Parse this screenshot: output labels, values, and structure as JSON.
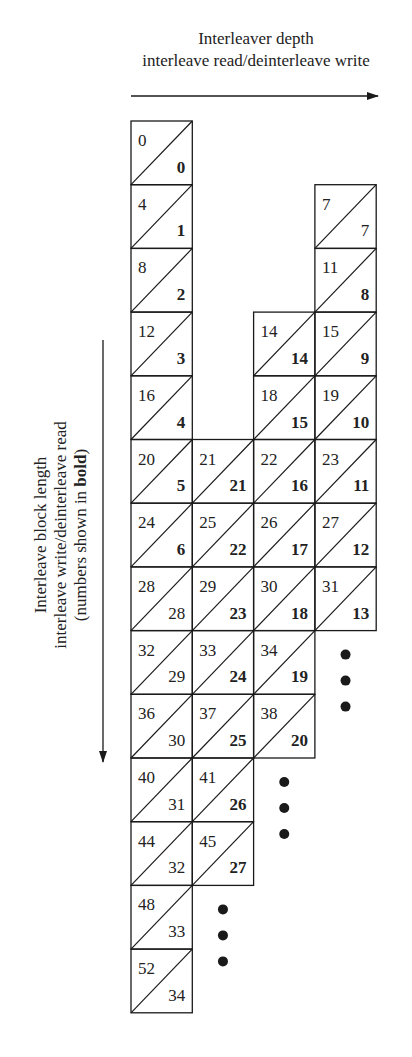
{
  "top_axis": {
    "title": "Interleaver depth",
    "subtitle": "interleave read/deinterleave write",
    "arrow_direction": "right"
  },
  "side_axis": {
    "title": "Interleave block length",
    "subtitle": "interleave write/deinterleave read",
    "note_prefix": "(numbers shown in ",
    "note_bold": "bold",
    "note_suffix": ")",
    "arrow_direction": "down"
  },
  "grid": {
    "origin_x": 131,
    "origin_y": 121,
    "col_width": 61.3,
    "row_height": 63.7,
    "columns": 4,
    "cells": [
      {
        "col": 0,
        "row": 0,
        "top": "0",
        "bottom": "0",
        "bold": true
      },
      {
        "col": 0,
        "row": 1,
        "top": "4",
        "bottom": "1",
        "bold": true
      },
      {
        "col": 0,
        "row": 2,
        "top": "8",
        "bottom": "2",
        "bold": true
      },
      {
        "col": 0,
        "row": 3,
        "top": "12",
        "bottom": "3",
        "bold": true
      },
      {
        "col": 0,
        "row": 4,
        "top": "16",
        "bottom": "4",
        "bold": true
      },
      {
        "col": 0,
        "row": 5,
        "top": "20",
        "bottom": "5",
        "bold": true
      },
      {
        "col": 0,
        "row": 6,
        "top": "24",
        "bottom": "6",
        "bold": true
      },
      {
        "col": 0,
        "row": 7,
        "top": "28",
        "bottom": "28",
        "bold": false
      },
      {
        "col": 0,
        "row": 8,
        "top": "32",
        "bottom": "29",
        "bold": false
      },
      {
        "col": 0,
        "row": 9,
        "top": "36",
        "bottom": "30",
        "bold": false
      },
      {
        "col": 0,
        "row": 10,
        "top": "40",
        "bottom": "31",
        "bold": false
      },
      {
        "col": 0,
        "row": 11,
        "top": "44",
        "bottom": "32",
        "bold": false
      },
      {
        "col": 0,
        "row": 12,
        "top": "48",
        "bottom": "33",
        "bold": false
      },
      {
        "col": 0,
        "row": 13,
        "top": "52",
        "bottom": "34",
        "bold": false
      },
      {
        "col": 1,
        "row": 5,
        "top": "21",
        "bottom": "21",
        "bold": true
      },
      {
        "col": 1,
        "row": 6,
        "top": "25",
        "bottom": "22",
        "bold": true
      },
      {
        "col": 1,
        "row": 7,
        "top": "29",
        "bottom": "23",
        "bold": true
      },
      {
        "col": 1,
        "row": 8,
        "top": "33",
        "bottom": "24",
        "bold": true
      },
      {
        "col": 1,
        "row": 9,
        "top": "37",
        "bottom": "25",
        "bold": true
      },
      {
        "col": 1,
        "row": 10,
        "top": "41",
        "bottom": "26",
        "bold": true
      },
      {
        "col": 1,
        "row": 11,
        "top": "45",
        "bottom": "27",
        "bold": true
      },
      {
        "col": 2,
        "row": 3,
        "top": "14",
        "bottom": "14",
        "bold": true
      },
      {
        "col": 2,
        "row": 4,
        "top": "18",
        "bottom": "15",
        "bold": true
      },
      {
        "col": 2,
        "row": 5,
        "top": "22",
        "bottom": "16",
        "bold": true
      },
      {
        "col": 2,
        "row": 6,
        "top": "26",
        "bottom": "17",
        "bold": true
      },
      {
        "col": 2,
        "row": 7,
        "top": "30",
        "bottom": "18",
        "bold": true
      },
      {
        "col": 2,
        "row": 8,
        "top": "34",
        "bottom": "19",
        "bold": true
      },
      {
        "col": 2,
        "row": 9,
        "top": "38",
        "bottom": "20",
        "bold": true
      },
      {
        "col": 3,
        "row": 1,
        "top": "7",
        "bottom": "7",
        "bold": false
      },
      {
        "col": 3,
        "row": 2,
        "top": "11",
        "bottom": "8",
        "bold": true
      },
      {
        "col": 3,
        "row": 3,
        "top": "15",
        "bottom": "9",
        "bold": true
      },
      {
        "col": 3,
        "row": 4,
        "top": "19",
        "bottom": "10",
        "bold": true
      },
      {
        "col": 3,
        "row": 5,
        "top": "23",
        "bottom": "11",
        "bold": true
      },
      {
        "col": 3,
        "row": 6,
        "top": "27",
        "bottom": "12",
        "bold": true
      },
      {
        "col": 3,
        "row": 7,
        "top": "31",
        "bottom": "13",
        "bold": true
      }
    ],
    "ellipses": [
      {
        "col": 3,
        "start_row": 8,
        "dots": 3
      },
      {
        "col": 2,
        "start_row": 10,
        "dots": 3
      },
      {
        "col": 1,
        "start_row": 12,
        "dots": 3
      }
    ]
  },
  "colors": {
    "line": "#1a1a1a",
    "text": "#222222",
    "background": "#ffffff"
  }
}
